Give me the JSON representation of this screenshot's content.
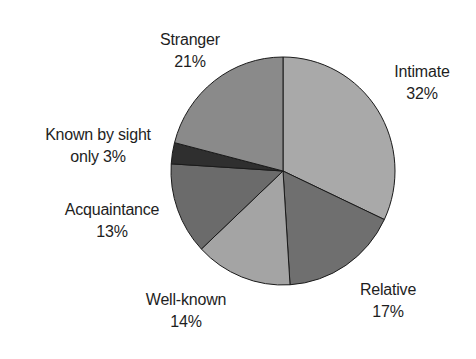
{
  "chart_data": {
    "type": "pie",
    "title": "",
    "start_angle_deg": 0,
    "direction": "clockwise",
    "categories": [
      "Intimate",
      "Relative",
      "Well-known",
      "Acquaintance",
      "Known by sight only",
      "Stranger"
    ],
    "values": [
      32,
      17,
      14,
      13,
      3,
      21
    ],
    "units": "%",
    "slices": [
      {
        "name": "Intimate",
        "value": 32,
        "label_line1": "Intimate",
        "label_line2": "32%",
        "color": "#a9a9a9"
      },
      {
        "name": "Relative",
        "value": 17,
        "label_line1": "Relative",
        "label_line2": "17%",
        "color": "#6f6f6f"
      },
      {
        "name": "Well-known",
        "value": 14,
        "label_line1": "Well-known",
        "label_line2": "14%",
        "color": "#a4a4a4"
      },
      {
        "name": "Acquaintance",
        "value": 13,
        "label_line1": "Acquaintance",
        "label_line2": "13%",
        "color": "#6b6b6b"
      },
      {
        "name": "Known by sight only",
        "value": 3,
        "label_line1": "Known by sight",
        "label_line2": "only 3%",
        "color": "#2f2f2f"
      },
      {
        "name": "Stranger",
        "value": 21,
        "label_line1": "Stranger",
        "label_line2": "21%",
        "color": "#8a8a8a"
      }
    ],
    "legend": "none (direct labels)"
  },
  "geometry": {
    "cx": 283,
    "cy": 171,
    "rx": 112,
    "ry": 114
  }
}
